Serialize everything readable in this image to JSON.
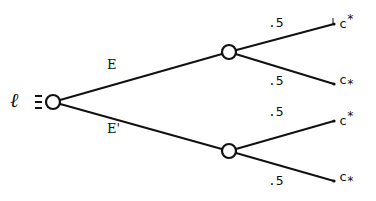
{
  "diagram": {
    "type": "probability-tree",
    "root": {
      "label": "ℓ",
      "relation_symbol": "≡"
    },
    "branches": [
      {
        "label": "E",
        "children": [
          {
            "probability": ".5",
            "outcome_base": "c",
            "outcome_mark": "*",
            "mark_position": "superscript"
          },
          {
            "probability": ".5",
            "outcome_base": "c",
            "outcome_mark": "*",
            "mark_position": "subscript"
          }
        ]
      },
      {
        "label": "E'",
        "children": [
          {
            "probability": ".5",
            "outcome_base": "c",
            "outcome_mark": "*",
            "mark_position": "superscript"
          },
          {
            "probability": ".5",
            "outcome_base": "c",
            "outcome_mark": "*",
            "mark_position": "subscript"
          }
        ]
      }
    ],
    "colors": {
      "line": "#111111",
      "background": "#ffffff"
    }
  }
}
